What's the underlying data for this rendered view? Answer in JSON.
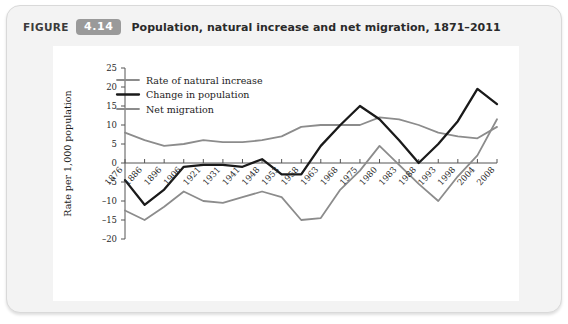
{
  "figure": {
    "label": "FIGURE",
    "number": "4.14",
    "title": "Population, natural increase and net migration, 1871–2011",
    "badge_color": "#9a9a9a",
    "card_background": "#f3f3f3",
    "panel_background": "#ffffff"
  },
  "chart_data": {
    "type": "line",
    "title": "Population, natural increase and net migration, 1871–2011",
    "xlabel": "",
    "ylabel": "Rate per 1,000 population",
    "ylim": [
      -20,
      25
    ],
    "ytick_step": 5,
    "yticks": [
      25,
      20,
      15,
      10,
      5,
      0,
      -5,
      -10,
      -15,
      -20
    ],
    "ytick_labels": [
      "25",
      "20",
      "15",
      "10",
      "5",
      "0",
      "–5",
      "–10",
      "–15",
      "–20"
    ],
    "grid": false,
    "legend_position": "top-left",
    "categories": [
      "1876",
      "1886",
      "1896",
      "1906",
      "1921",
      "1931",
      "1941",
      "1948",
      "1953",
      "1958",
      "1963",
      "1968",
      "1975",
      "1980",
      "1983",
      "1988",
      "1993",
      "1998",
      "2004",
      "2008"
    ],
    "series": [
      {
        "name": "Rate of natural increase",
        "color": "#8c8c8c",
        "width": 1.8,
        "values": [
          8.0,
          6.0,
          4.5,
          5.0,
          6.0,
          5.5,
          5.5,
          6.0,
          7.0,
          9.5,
          10.0,
          10.0,
          10.0,
          12.0,
          11.5,
          10.0,
          8.0,
          7.0,
          6.5,
          9.5
        ]
      },
      {
        "name": "Change in population",
        "color": "#1a1a1a",
        "width": 2.3,
        "values": [
          -4.5,
          -11.0,
          -7.0,
          -1.0,
          -0.5,
          -0.5,
          -1.0,
          1.0,
          -3.0,
          -3.0,
          4.5,
          10.0,
          15.0,
          11.5,
          6.0,
          0.0,
          5.0,
          11.0,
          19.5,
          15.5
        ]
      },
      {
        "name": "Net migration",
        "color": "#8c8c8c",
        "width": 1.8,
        "values": [
          -12.5,
          -15.0,
          -11.5,
          -7.5,
          -10.0,
          -10.5,
          -9.0,
          -7.5,
          -9.0,
          -15.0,
          -14.5,
          -7.0,
          -2.0,
          4.5,
          -0.5,
          -5.5,
          -10.0,
          -3.5,
          2.0,
          11.5
        ]
      }
    ]
  }
}
